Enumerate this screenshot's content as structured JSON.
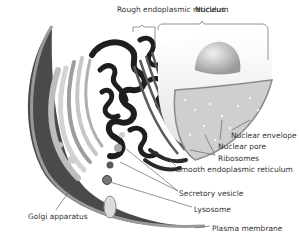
{
  "diagram": {
    "labels": [
      {
        "id": "rough_er",
        "text": "Rough endoplasmic reticulum",
        "x": 117,
        "y": 5
      },
      {
        "id": "nucleus",
        "text": "Nucleus",
        "x": 195,
        "y": 5
      },
      {
        "id": "nuclear_envelope",
        "text": "Nuclear envelope",
        "x": 231,
        "y": 131
      },
      {
        "id": "nuclear_pore",
        "text": "Nuclear pore",
        "x": 218,
        "y": 142
      },
      {
        "id": "ribosomes",
        "text": "Ribosomes",
        "x": 218,
        "y": 154
      },
      {
        "id": "smooth_er",
        "text": "Smooth endoplasmic reticulum",
        "x": 176,
        "y": 165
      },
      {
        "id": "secretory_vesicle",
        "text": "Secretory vesicle",
        "x": 179,
        "y": 189
      },
      {
        "id": "lysosome",
        "text": "Lysosome",
        "x": 194,
        "y": 205
      },
      {
        "id": "golgi",
        "text": "Golgi apparatus",
        "x": 28,
        "y": 212
      },
      {
        "id": "plasma_membrane",
        "text": "Plasma membrane",
        "x": 212,
        "y": 224
      }
    ],
    "colors": {
      "membrane_dark": "#4a4a4a",
      "er_black": "#1e1e1e",
      "nucleus_light": "#e8e8e8",
      "nucleolus": "#bdbdbd",
      "golgi_gray": "#aaaaaa",
      "leader_line": "#666666"
    }
  }
}
